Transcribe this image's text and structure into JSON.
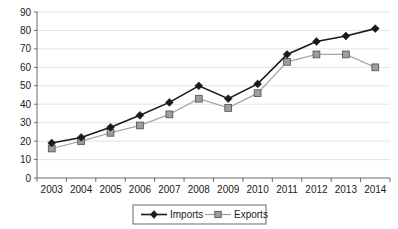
{
  "chart_data": {
    "type": "line",
    "title": "",
    "subtitle": "",
    "xlabel": "",
    "ylabel": "",
    "categories": [
      "2003",
      "2004",
      "2005",
      "2006",
      "2007",
      "2008",
      "2009",
      "2010",
      "2011",
      "2012",
      "2013",
      "2014"
    ],
    "series": [
      {
        "name": "Imports",
        "marker": "diamond",
        "color": "#1a1a1a",
        "values": [
          19,
          22,
          27.5,
          34,
          41,
          50,
          43,
          51,
          67,
          74,
          77,
          81
        ]
      },
      {
        "name": "Exports",
        "marker": "square",
        "color": "#9e9e9e",
        "values": [
          16,
          20,
          24.5,
          28.5,
          34.5,
          43,
          38,
          46,
          63,
          67,
          67,
          60
        ]
      }
    ],
    "ylim": [
      0,
      90
    ],
    "yticks": [
      0,
      10,
      20,
      30,
      40,
      50,
      60,
      70,
      80,
      90
    ],
    "ytick_labels": [
      "0",
      "10",
      "20",
      "30",
      "40",
      "50",
      "60",
      "70",
      "80",
      "90"
    ],
    "xtick_labels": [
      "2003",
      "2004",
      "2005",
      "2006",
      "2007",
      "2008",
      "2009",
      "2010",
      "2011",
      "2012",
      "2013",
      "2014"
    ],
    "grid": "horizontal",
    "legend_position": "bottom-center",
    "legend_entries": [
      "Imports",
      "Exports"
    ]
  },
  "legend": {
    "imports_label": "Imports",
    "exports_label": "Exports"
  },
  "colors": {
    "imports": "#1a1a1a",
    "exports": "#9e9e9e",
    "gridline": "#d9d9d9",
    "axis": "#6b6b6b",
    "background": "#ffffff"
  }
}
